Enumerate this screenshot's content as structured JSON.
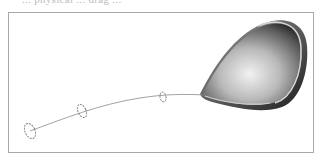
{
  "caption_fragment": "... physical ... drag ... ",
  "figure": {
    "elements": {
      "shell": {
        "fill_light": "#ececec",
        "fill_dark": "#3a3a3a",
        "rim": "#bfbfbf"
      },
      "tether": {
        "color": "#8a8a8a"
      },
      "rings": [
        {
          "name": "ring-1",
          "cx": 30,
          "cy": 131
        },
        {
          "name": "ring-2",
          "cx": 82,
          "cy": 112
        },
        {
          "name": "ring-3",
          "cx": 163,
          "cy": 98
        }
      ]
    },
    "frame_color": "#a9a9a9"
  }
}
